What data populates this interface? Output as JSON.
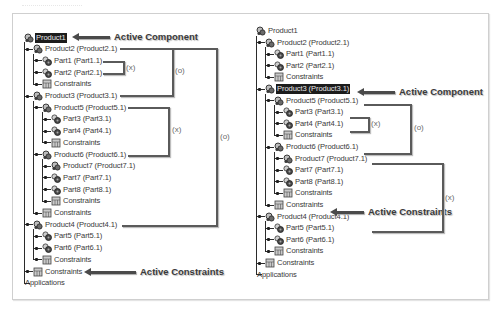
{
  "left_panel": {
    "nodes": [
      {
        "label": "Product1",
        "type": "product",
        "active": true
      },
      {
        "label": "Product2 (Product2.1)",
        "type": "product"
      },
      {
        "label": "Part1 (Part1.1)",
        "type": "part"
      },
      {
        "label": "Part2 (Part2.1)",
        "type": "part"
      },
      {
        "label": "Constraints",
        "type": "constraints"
      },
      {
        "label": "Product3 (Product3.1)",
        "type": "product"
      },
      {
        "label": "Product5 (Product5.1)",
        "type": "product"
      },
      {
        "label": "Part3 (Part3.1)",
        "type": "part"
      },
      {
        "label": "Part4 (Part4.1)",
        "type": "part"
      },
      {
        "label": "Constraints",
        "type": "constraints"
      },
      {
        "label": "Product6 (Product6.1)",
        "type": "product"
      },
      {
        "label": "Product7 (Product7.1)",
        "type": "product"
      },
      {
        "label": "Part7 (Part7.1)",
        "type": "part"
      },
      {
        "label": "Part8 (Part8.1)",
        "type": "part"
      },
      {
        "label": "Constraints",
        "type": "constraints"
      },
      {
        "label": "Constraints",
        "type": "constraints"
      },
      {
        "label": "Product4 (Product4.1)",
        "type": "product"
      },
      {
        "label": "Part5 (Part5.1)",
        "type": "part"
      },
      {
        "label": "Part6 (Part6.1)",
        "type": "part"
      },
      {
        "label": "Constraints",
        "type": "constraints"
      },
      {
        "label": "Constraints",
        "type": "constraints"
      },
      {
        "label": "Applications",
        "type": "applications"
      }
    ],
    "callouts": {
      "active_component": "Active Component",
      "active_constraints": "Active Constraints"
    },
    "brackets": {
      "x1": "(x)",
      "o1": "(o)",
      "x2": "(x)",
      "o2": "(o)"
    }
  },
  "right_panel": {
    "nodes": [
      {
        "label": "Product1",
        "type": "product"
      },
      {
        "label": "Product2 (Product2.1)",
        "type": "product"
      },
      {
        "label": "Part1 (Part1.1)",
        "type": "part"
      },
      {
        "label": "Part2 (Part2.1)",
        "type": "part"
      },
      {
        "label": "Constraints",
        "type": "constraints"
      },
      {
        "label": "Product3 (Product3.1)",
        "type": "product",
        "active": true
      },
      {
        "label": "Product5 (Product5.1)",
        "type": "product"
      },
      {
        "label": "Part3 (Part3.1)",
        "type": "part"
      },
      {
        "label": "Part4 (Part4.1)",
        "type": "part"
      },
      {
        "label": "Constraints",
        "type": "constraints"
      },
      {
        "label": "Product6 (Product6.1)",
        "type": "product"
      },
      {
        "label": "Product7 (Product7.1)",
        "type": "product"
      },
      {
        "label": "Part7 (Part7.1)",
        "type": "part"
      },
      {
        "label": "Part8 (Part8.1)",
        "type": "part"
      },
      {
        "label": "Constraints",
        "type": "constraints"
      },
      {
        "label": "Constraints",
        "type": "constraints"
      },
      {
        "label": "Product4 (Product4.1)",
        "type": "product"
      },
      {
        "label": "Part5 (Part5.1)",
        "type": "part"
      },
      {
        "label": "Part6 (Part6.1)",
        "type": "part"
      },
      {
        "label": "Constraints",
        "type": "constraints"
      },
      {
        "label": "Constraints",
        "type": "constraints"
      },
      {
        "label": "Applications",
        "type": "applications"
      }
    ],
    "callouts": {
      "active_component": "Active Component",
      "active_constraints": "Active Constraints"
    },
    "brackets": {
      "x1": "(x)",
      "o1": "(o)",
      "x2": "(x)"
    }
  },
  "icons": {
    "product": "product-assembly-icon",
    "part": "part-gear-icon",
    "constraints": "constraints-icon"
  }
}
